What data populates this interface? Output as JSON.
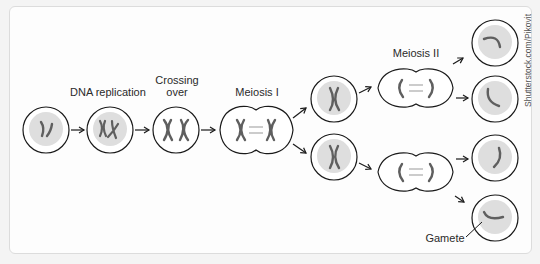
{
  "labels": {
    "dna_replication": "DNA replication",
    "crossing_over": "Crossing over",
    "crossing_over_line1": "Crossing",
    "crossing_over_line2": "over",
    "meiosis_1": "Meiosis I",
    "meiosis_2": "Meiosis II",
    "gamete": "Gamete"
  },
  "credit": "Shutterstock.com/Pikovit",
  "stages": [
    {
      "id": "parent-cell",
      "chromosomes": "two unreplicated chromosomes"
    },
    {
      "id": "dna-replication",
      "chromosomes": "replicated chromosomes"
    },
    {
      "id": "crossing-over",
      "chromosomes": "homologous pair crossing"
    },
    {
      "id": "meiosis-1",
      "chromosomes": "homologs separating"
    },
    {
      "id": "daughter-cells",
      "count": 2
    },
    {
      "id": "meiosis-2",
      "count": 2
    },
    {
      "id": "gametes",
      "count": 4
    }
  ],
  "colors": {
    "outline": "#1a1a1a",
    "nucleus_fill": "#dedede",
    "chromosome": "#5f5f5f",
    "arrow": "#1a1a1a",
    "panel_border": "#dcdcdc",
    "background": "#f4f4f4"
  }
}
